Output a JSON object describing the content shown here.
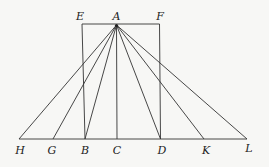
{
  "diagram": {
    "apex": {
      "label": "A",
      "x": 116.5,
      "y": 25
    },
    "rect": {
      "top_left": {
        "label": "E",
        "x": 82,
        "y": 24
      },
      "top_right": {
        "label": "F",
        "x": 159.5,
        "y": 24
      },
      "bottom_y": 139
    },
    "base": {
      "y": 139,
      "x1": 19,
      "x2": 247
    },
    "base_points": [
      {
        "label": "H",
        "x": 19
      },
      {
        "label": "G",
        "x": 53
      },
      {
        "label": "B",
        "x": 85
      },
      {
        "label": "C",
        "x": 117
      },
      {
        "label": "D",
        "x": 161
      },
      {
        "label": "K",
        "x": 204
      },
      {
        "label": "L",
        "x": 247
      }
    ],
    "colors": {
      "line": "#333333",
      "text": "#222222",
      "background": "#f7f7f5"
    }
  },
  "labels": {
    "E": "E",
    "A": "A",
    "F": "F",
    "H": "H",
    "G": "G",
    "B": "B",
    "C": "C",
    "D": "D",
    "K": "K",
    "L": "L"
  }
}
